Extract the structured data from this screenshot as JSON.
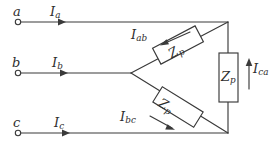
{
  "diagram": {
    "colors": {
      "background": "#ffffff",
      "wire": "#3a3a3a",
      "text": "#2e2e2e"
    },
    "terminals": [
      {
        "id": "a",
        "label": "a"
      },
      {
        "id": "b",
        "label": "b"
      },
      {
        "id": "c",
        "label": "c"
      }
    ],
    "line_currents": [
      {
        "id": "Ia",
        "symbol": "I",
        "subscript": "a"
      },
      {
        "id": "Ib",
        "symbol": "I",
        "subscript": "b"
      },
      {
        "id": "Ic",
        "symbol": "I",
        "subscript": "c"
      }
    ],
    "phase_currents": [
      {
        "id": "Iab",
        "symbol": "I",
        "subscript": "ab"
      },
      {
        "id": "Ibc",
        "symbol": "I",
        "subscript": "bc"
      },
      {
        "id": "Ica",
        "symbol": "I",
        "subscript": "ca"
      }
    ],
    "impedances": [
      {
        "id": "Zp-ab",
        "symbol": "Z",
        "subscript": "p"
      },
      {
        "id": "Zp-bc",
        "symbol": "Z",
        "subscript": "p"
      },
      {
        "id": "Zp-ca",
        "symbol": "Z",
        "subscript": "p"
      }
    ]
  }
}
